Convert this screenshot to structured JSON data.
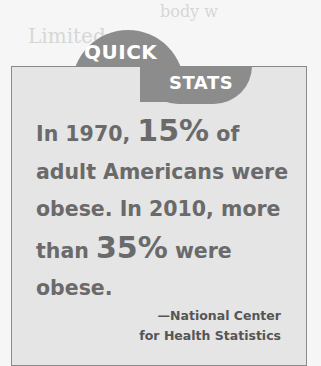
{
  "background_text": {
    "line1": "body w",
    "line2": "Limited"
  },
  "badge": {
    "top_label": "QUICK",
    "bottom_label": "STATS",
    "color": "#8c8c8c"
  },
  "stat": {
    "part1": "In 1970, ",
    "highlight1": "15%",
    "part2": " of adult Americans were obese. In 2010, more than ",
    "highlight2": "35%",
    "part3": " were obese."
  },
  "source": {
    "line1": "—National Center",
    "line2": "for Health Statistics"
  },
  "colors": {
    "box_background": "#e5e5e5",
    "text": "#6a6a6a",
    "border": "#8a8a8a"
  }
}
